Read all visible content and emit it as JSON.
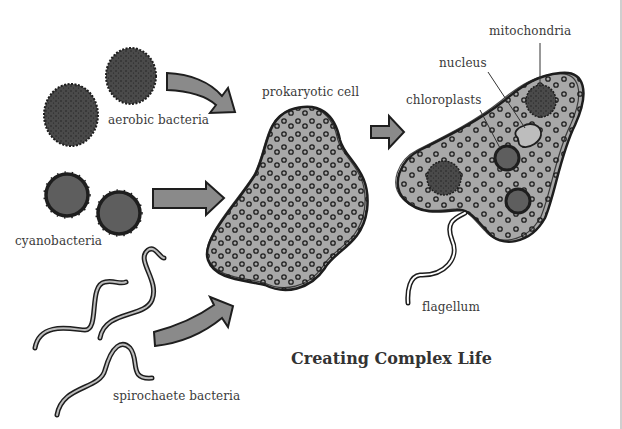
{
  "title": "Creating Complex Life",
  "labels": {
    "aerobic": "aerobic bacteria",
    "cyano": "cyanobacteria",
    "spiro": "spirochaete bacteria",
    "prokaryote": "prokaryotic cell",
    "mitochondria": "mitochondria",
    "nucleus": "nucleus",
    "chloroplasts": "chloroplasts",
    "flagellum": "flagellum"
  },
  "colors": {
    "outline": "#1e1e1e",
    "cytoplasm": "#a8a8a8",
    "aerobic_fill": "#4a4a4a",
    "cyano_fill": "#5e5e5e",
    "arrow_fill": "#8a8a8a",
    "text": "#3a3a3a",
    "background": "#ffffff"
  }
}
